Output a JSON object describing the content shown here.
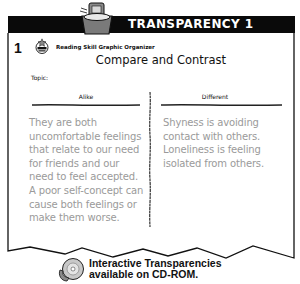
{
  "header": {
    "title": "TRANSPARENCY 1",
    "number": "1",
    "skill_label": "Reading Skill Graphic Organizer",
    "badge_icon": "focus-skill-badge"
  },
  "organizer": {
    "title": "Compare and Contrast",
    "topic_label": "Topic:",
    "columns": [
      {
        "heading": "Alike",
        "text": "They are both uncomfortable feelings that relate to our need for friends and our need to feel accepted. A poor self-concept can cause both feelings or make them worse."
      },
      {
        "heading": "Different",
        "text": "Shyness is avoiding contact with others. Loneliness is feeling isolated from others."
      }
    ]
  },
  "footer": {
    "line1": "Interactive Transparencies",
    "line2": "available on CD-ROM.",
    "icon": "cd-rom-icon"
  },
  "colors": {
    "header_bg": "#0a0a0a",
    "body_text": "#9a9a9a",
    "ink": "#111111"
  }
}
